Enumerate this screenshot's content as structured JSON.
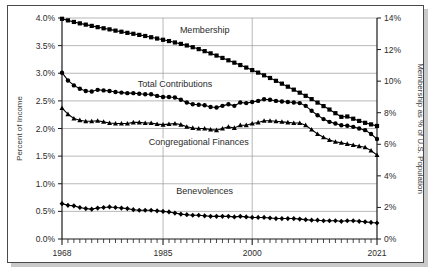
{
  "figure": {
    "frame_color": "#4a4a4a",
    "background": "#ffffff",
    "shadow_color": "#c9c9c9"
  },
  "chart_data": {
    "type": "line",
    "title": "",
    "subtitle": "",
    "xlabel": "",
    "ylabel": "Percent of Income",
    "y2label": "Membership as % of U.S. Population",
    "xlim": [
      1968,
      2021
    ],
    "ylim": [
      0.0,
      4.0
    ],
    "y2lim": [
      0,
      14
    ],
    "grid": true,
    "legend_position": "inline-annotation",
    "x_tick_labels": [
      "1968",
      "1985",
      "2000",
      "2021"
    ],
    "x_tick_values": [
      1968,
      1985,
      2000,
      2021
    ],
    "x_minor_ticks": "every year",
    "y_tick_labels": [
      "0.0%",
      "0.5%",
      "1.0%",
      "1.5%",
      "2.0%",
      "2.5%",
      "3.0%",
      "3.5%",
      "4.0%"
    ],
    "y_tick_values": [
      0.0,
      0.5,
      1.0,
      1.5,
      2.0,
      2.5,
      3.0,
      3.5,
      4.0
    ],
    "y2_tick_labels": [
      "0%",
      "2%",
      "4%",
      "6%",
      "8%",
      "10%",
      "12%",
      "14%"
    ],
    "y2_tick_values": [
      0,
      2,
      4,
      6,
      8,
      10,
      12,
      14
    ],
    "x": [
      1968,
      1969,
      1970,
      1971,
      1972,
      1973,
      1974,
      1975,
      1976,
      1977,
      1978,
      1979,
      1980,
      1981,
      1982,
      1983,
      1984,
      1985,
      1986,
      1987,
      1988,
      1989,
      1990,
      1991,
      1992,
      1993,
      1994,
      1995,
      1996,
      1997,
      1998,
      1999,
      2000,
      2001,
      2002,
      2003,
      2004,
      2005,
      2006,
      2007,
      2008,
      2009,
      2010,
      2011,
      2012,
      2013,
      2014,
      2015,
      2016,
      2017,
      2018,
      2019,
      2020,
      2021
    ],
    "series": [
      {
        "name": "Membership",
        "marker": "square",
        "axis": "right",
        "unit": "% of U.S. Population",
        "label_x": 1992,
        "label_y": 3.72,
        "values": [
          13.95,
          13.85,
          13.75,
          13.66,
          13.58,
          13.5,
          13.42,
          13.35,
          13.28,
          13.2,
          13.13,
          13.06,
          13.0,
          12.93,
          12.86,
          12.78,
          12.7,
          12.62,
          12.54,
          12.45,
          12.36,
          12.26,
          12.15,
          12.03,
          11.9,
          11.76,
          11.62,
          11.47,
          11.32,
          11.17,
          11.02,
          10.86,
          10.7,
          10.54,
          10.37,
          10.2,
          10.02,
          9.84,
          9.65,
          9.46,
          9.27,
          9.07,
          8.86,
          8.64,
          8.42,
          8.2,
          7.97,
          7.74,
          7.76,
          7.62,
          7.48,
          7.36,
          7.26,
          7.16
        ]
      },
      {
        "name": "Total Contributions",
        "marker": "circle",
        "axis": "left",
        "unit": "% of Income",
        "label_x": 1987,
        "label_y": 2.75,
        "values": [
          3.01,
          2.87,
          2.78,
          2.72,
          2.68,
          2.67,
          2.7,
          2.69,
          2.68,
          2.66,
          2.65,
          2.64,
          2.64,
          2.63,
          2.62,
          2.62,
          2.59,
          2.57,
          2.57,
          2.56,
          2.52,
          2.47,
          2.44,
          2.43,
          2.42,
          2.39,
          2.38,
          2.41,
          2.44,
          2.41,
          2.47,
          2.46,
          2.48,
          2.5,
          2.53,
          2.52,
          2.5,
          2.49,
          2.48,
          2.47,
          2.46,
          2.41,
          2.32,
          2.24,
          2.17,
          2.12,
          2.09,
          2.06,
          2.05,
          2.03,
          2.0,
          1.97,
          1.9,
          1.81
        ]
      },
      {
        "name": "Congregational Finances",
        "marker": "triangle",
        "axis": "left",
        "unit": "% of Income",
        "label_x": 1991,
        "label_y": 1.7,
        "values": [
          2.37,
          2.26,
          2.18,
          2.15,
          2.13,
          2.13,
          2.14,
          2.12,
          2.1,
          2.09,
          2.09,
          2.09,
          2.11,
          2.11,
          2.1,
          2.1,
          2.08,
          2.07,
          2.08,
          2.09,
          2.07,
          2.03,
          2.01,
          2.0,
          2.0,
          1.98,
          1.97,
          2.0,
          2.03,
          2.01,
          2.06,
          2.06,
          2.09,
          2.11,
          2.14,
          2.14,
          2.13,
          2.12,
          2.11,
          2.1,
          2.1,
          2.06,
          1.98,
          1.9,
          1.84,
          1.79,
          1.76,
          1.74,
          1.72,
          1.7,
          1.68,
          1.66,
          1.6,
          1.52
        ]
      },
      {
        "name": "Benevolences",
        "marker": "diamond",
        "axis": "left",
        "unit": "% of Income",
        "label_x": 1992,
        "label_y": 0.82,
        "values": [
          0.64,
          0.61,
          0.6,
          0.57,
          0.55,
          0.54,
          0.56,
          0.57,
          0.58,
          0.57,
          0.56,
          0.55,
          0.53,
          0.52,
          0.52,
          0.52,
          0.51,
          0.5,
          0.49,
          0.47,
          0.45,
          0.44,
          0.43,
          0.43,
          0.42,
          0.41,
          0.41,
          0.41,
          0.41,
          0.4,
          0.41,
          0.4,
          0.39,
          0.39,
          0.39,
          0.38,
          0.37,
          0.37,
          0.37,
          0.37,
          0.36,
          0.35,
          0.34,
          0.34,
          0.33,
          0.33,
          0.33,
          0.32,
          0.33,
          0.33,
          0.32,
          0.31,
          0.3,
          0.29
        ]
      }
    ]
  }
}
